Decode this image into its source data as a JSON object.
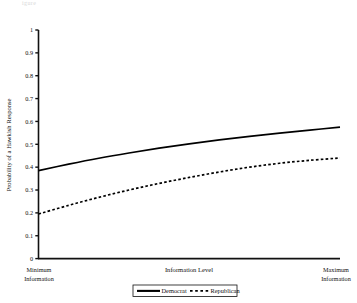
{
  "figure": {
    "corner_fragment": "igure"
  },
  "chart_data": {
    "type": "line",
    "title": "",
    "xlabel": "Information Level",
    "ylabel": "Probability of a Hawkish Response",
    "xlim": [
      0,
      1
    ],
    "ylim": [
      0,
      1
    ],
    "grid": false,
    "x_axis_endpoint_labels": {
      "left_line1": "Minimum",
      "left_line2": "Information",
      "right_line1": "Maximum",
      "right_line2": "Information"
    },
    "yticks": [
      "0",
      "0.1",
      "0.2",
      "0.3",
      "0.4",
      "0.5",
      "0.6",
      "0.7",
      "0.8",
      "0.9",
      "1"
    ],
    "ytick_values": [
      0,
      0.1,
      0.2,
      0.3,
      0.4,
      0.5,
      0.6,
      0.7,
      0.8,
      0.9,
      1
    ],
    "x": [
      0,
      0.1,
      0.2,
      0.3,
      0.4,
      0.5,
      0.6,
      0.7,
      0.8,
      0.9,
      1
    ],
    "series": [
      {
        "name": "Democrat",
        "style": "solid",
        "color": "#000000",
        "values": [
          0.385,
          0.413,
          0.439,
          0.462,
          0.483,
          0.502,
          0.519,
          0.535,
          0.549,
          0.562,
          0.575
        ]
      },
      {
        "name": "Republican",
        "style": "dashed",
        "color": "#000000",
        "values": [
          0.195,
          0.233,
          0.268,
          0.3,
          0.329,
          0.355,
          0.379,
          0.4,
          0.417,
          0.43,
          0.44
        ]
      }
    ],
    "legend": {
      "position": "below-axis-center",
      "entries": [
        {
          "label": "Democrat",
          "style": "solid"
        },
        {
          "label": "Republican",
          "style": "dashed"
        }
      ]
    }
  }
}
